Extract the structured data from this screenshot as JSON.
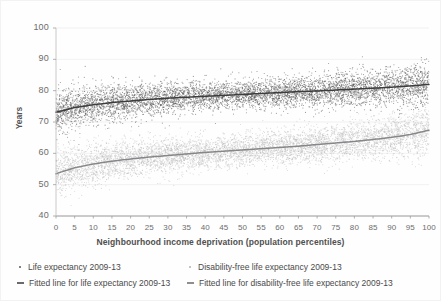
{
  "chart_data": {
    "type": "scatter",
    "title": "",
    "xlabel": "Neighbourhood income deprivation (population percentiles)",
    "ylabel": "Years",
    "xlim": [
      0,
      100
    ],
    "ylim": [
      40,
      100
    ],
    "xticks": [
      0,
      5,
      10,
      15,
      20,
      25,
      30,
      35,
      40,
      45,
      50,
      55,
      60,
      65,
      70,
      75,
      80,
      85,
      90,
      95,
      100
    ],
    "yticks": [
      40,
      50,
      60,
      70,
      80,
      90,
      100
    ],
    "grid": "horizontal-faint",
    "legend_position": "below-axis",
    "colors": {
      "life_expectancy_points": "#58585a",
      "life_expectancy_line": "#3d3d3f",
      "disability_free_points": "#b9b9bb",
      "disability_free_line": "#87878a",
      "axis": "#9a9a9a",
      "text": "#5a5a5a"
    },
    "series": [
      {
        "name": "Life expectancy 2009-13",
        "kind": "scatter",
        "color": "#58585a",
        "n_points_approx": 6000,
        "spread_sd_years": 2.4,
        "x": [
          0,
          5,
          10,
          15,
          20,
          25,
          30,
          35,
          40,
          45,
          50,
          55,
          60,
          65,
          70,
          75,
          80,
          85,
          90,
          95,
          100
        ],
        "y_mean": [
          73.1,
          74.6,
          75.5,
          76.2,
          76.7,
          77.2,
          77.6,
          77.9,
          78.2,
          78.5,
          78.8,
          79.1,
          79.4,
          79.7,
          79.9,
          80.2,
          80.5,
          80.8,
          81.1,
          81.5,
          82.0
        ]
      },
      {
        "name": "Fitted line for life expectancy 2009-13",
        "kind": "line",
        "color": "#3d3d3f",
        "x": [
          0,
          5,
          10,
          15,
          20,
          25,
          30,
          35,
          40,
          45,
          50,
          55,
          60,
          65,
          70,
          75,
          80,
          85,
          90,
          95,
          100
        ],
        "values": [
          73.1,
          74.6,
          75.5,
          76.2,
          76.7,
          77.2,
          77.6,
          77.9,
          78.2,
          78.5,
          78.8,
          79.1,
          79.4,
          79.7,
          79.9,
          80.2,
          80.5,
          80.8,
          81.1,
          81.5,
          82.0
        ]
      },
      {
        "name": "Disability-free life expectancy 2009-13",
        "kind": "scatter",
        "color": "#b9b9bb",
        "n_points_approx": 6000,
        "spread_sd_years": 2.6,
        "x": [
          0,
          5,
          10,
          15,
          20,
          25,
          30,
          35,
          40,
          45,
          50,
          55,
          60,
          65,
          70,
          75,
          80,
          85,
          90,
          95,
          100
        ],
        "y_mean": [
          53.5,
          55.4,
          56.6,
          57.5,
          58.2,
          58.8,
          59.3,
          59.8,
          60.3,
          60.7,
          61.1,
          61.5,
          61.9,
          62.3,
          62.8,
          63.3,
          63.8,
          64.4,
          65.1,
          66.0,
          67.4
        ]
      },
      {
        "name": "Fitted line for disability-free life expectancy 2009-13",
        "kind": "line",
        "color": "#87878a",
        "x": [
          0,
          5,
          10,
          15,
          20,
          25,
          30,
          35,
          40,
          45,
          50,
          55,
          60,
          65,
          70,
          75,
          80,
          85,
          90,
          95,
          100
        ],
        "values": [
          53.5,
          55.4,
          56.6,
          57.5,
          58.2,
          58.8,
          59.3,
          59.8,
          60.3,
          60.7,
          61.1,
          61.5,
          61.9,
          62.3,
          62.8,
          63.3,
          63.8,
          64.4,
          65.1,
          66.0,
          67.4
        ]
      }
    ]
  },
  "axes": {
    "y_title": "Years",
    "x_title": "Neighbourhood income deprivation (population percentiles)",
    "y_tick_labels": [
      "100",
      "90",
      "80",
      "70",
      "60",
      "50",
      "40"
    ],
    "x_tick_labels": [
      "0",
      "5",
      "10",
      "15",
      "20",
      "25",
      "30",
      "35",
      "40",
      "45",
      "50",
      "55",
      "60",
      "65",
      "70",
      "75",
      "80",
      "85",
      "90",
      "95",
      "100"
    ]
  },
  "legend": {
    "items": [
      {
        "marker": "dot",
        "label": "Life expectancy 2009-13",
        "color": "#58585a"
      },
      {
        "marker": "dot",
        "label": "Disability-free life expectancy 2009-13",
        "color": "#b0b0b2"
      },
      {
        "marker": "line",
        "label": "Fitted line for life expectancy 2009-13",
        "color": "#6a6a6c"
      },
      {
        "marker": "line",
        "label": "Fitted line for disability-free life expectancy 2009-13",
        "color": "#8e8e90"
      }
    ]
  }
}
